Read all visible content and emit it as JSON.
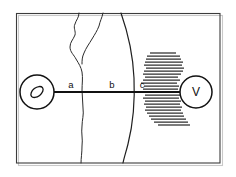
{
  "figure": {
    "background_color": "#ffffff",
    "width": 236,
    "height": 177,
    "frame": {
      "name": "outer-frame",
      "x": 16,
      "y": 13,
      "width": 204,
      "height": 150,
      "stroke_color": "#3c3c3c"
    },
    "axis": {
      "name": "horizontal-axis",
      "y": 92,
      "x_start": 54,
      "x_end": 181,
      "stroke_color": "#111111"
    },
    "segment_labels": [
      {
        "id": "a",
        "text": "a",
        "x": 71,
        "y": 88
      },
      {
        "id": "b",
        "text": "b",
        "x": 112,
        "y": 88
      },
      {
        "id": "c",
        "text": "c",
        "x": 142,
        "y": 88
      }
    ],
    "nodes": [
      {
        "id": "left-node",
        "label": "",
        "shape": "circle-with-ellipse",
        "cx": 37,
        "cy": 92,
        "r": 17,
        "inner_label": "ellipse-marker",
        "stroke_color": "#121212"
      },
      {
        "id": "right-node",
        "label": "V",
        "shape": "circle",
        "cx": 196,
        "cy": 92,
        "r": 16,
        "stroke_color": "#121212"
      }
    ],
    "features": [
      {
        "id": "wiggly-branching-line",
        "kind": "irregular-vertical-line",
        "description": "branching squiggly line forking near the top",
        "stroke_color": "#2b2b2b"
      },
      {
        "id": "smooth-arc-curve",
        "kind": "vertical-arc",
        "description": "smooth arc bulging to the right",
        "stroke_color": "#202020"
      },
      {
        "id": "hatched-blob",
        "kind": "horizontal-hatching",
        "description": "irregular blob of horizontal hatch lines surrounding the right node",
        "line_count": 24,
        "stroke_color": "#2e2e2e"
      }
    ]
  }
}
